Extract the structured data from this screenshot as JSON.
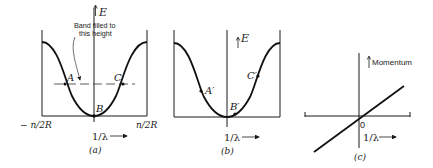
{
  "panels": [
    {
      "id": "a",
      "caption": "(a)",
      "y_axis_label": "E",
      "x_axis_label": "1/λ",
      "left_limit_label": "− n/2R",
      "right_limit_label": "n/2R",
      "annotation": {
        "line1": "Band filled to",
        "line2": "this height"
      },
      "points": {
        "A": "A",
        "B": "B",
        "C": "C"
      }
    },
    {
      "id": "b",
      "caption": "(b)",
      "y_axis_label": "E",
      "x_axis_label": "1/λ",
      "points": {
        "A": "A′",
        "B": "B′",
        "C": "C′"
      }
    },
    {
      "id": "c",
      "caption": "(c)",
      "y_axis_label": "Momentum",
      "x_axis_label": "1/λ",
      "origin_label": "0"
    }
  ],
  "arrow": "⟶"
}
